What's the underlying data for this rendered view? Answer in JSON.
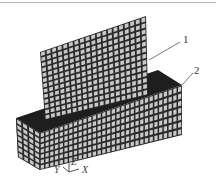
{
  "figure": {
    "type": "finite-element-mesh",
    "colors": {
      "mesh_cell": "#c8c8c8",
      "mesh_line": "#2a2a2a",
      "dark_face": "#1e1e1e",
      "border": "#b5b5b5",
      "leader": "#555555"
    },
    "parts": [
      {
        "id": "plate",
        "label": "1",
        "grid": {
          "cols": 19,
          "rows": 13
        }
      },
      {
        "id": "base-block",
        "label": "2",
        "grid": {
          "cols": 30,
          "rows": 7
        }
      }
    ],
    "axes": {
      "x": "X",
      "y": "Y",
      "z": "Z"
    }
  }
}
